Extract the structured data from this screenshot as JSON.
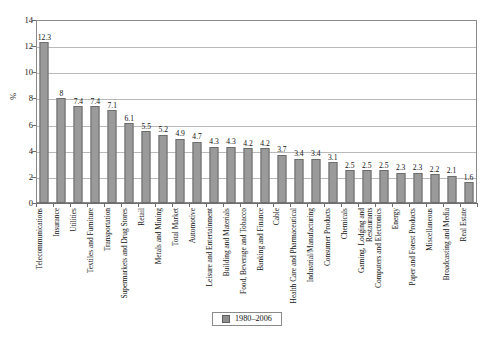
{
  "chart_data": {
    "type": "bar",
    "title": "",
    "xlabel": "",
    "ylabel": "%",
    "ylim": [
      0,
      14
    ],
    "ytick_step": 2,
    "yticks": [
      0,
      2,
      4,
      6,
      8,
      10,
      12,
      14
    ],
    "grid": true,
    "legend_position": "bottom-center",
    "series": [
      {
        "name": "1980–2006",
        "values": [
          12.3,
          8,
          7.4,
          7.4,
          7.1,
          6.1,
          5.5,
          5.2,
          4.9,
          4.7,
          4.3,
          4.3,
          4.2,
          4.2,
          3.7,
          3.4,
          3.4,
          3.1,
          2.5,
          2.5,
          2.5,
          2.3,
          2.3,
          2.2,
          2.1,
          1.6
        ]
      }
    ],
    "categories": [
      "Telecommunications",
      "Insurance",
      "Utilities",
      "Textiles and Furniture",
      "Transportation",
      "Supermarkets and Drug Stores",
      "Retail",
      "Metals and Mining",
      "Total Market",
      "Automotive",
      "Leisure and Entertainment",
      "Building and Materials",
      "Food, Beverage and Tobacco",
      "Banking and Finance",
      "Cable",
      "Health Care and Pharmaceutical",
      "Industrial/Manufacturing",
      "Consumer Products",
      "Chemicals",
      "Gaming, Lodging and Restaurants",
      "Computers and Electronics",
      "Energy",
      "Paper and Forest Products",
      "Miscellaneous",
      "Broadcasting and Media",
      "Real Estate"
    ],
    "value_labels": [
      "12.3",
      "8",
      "7.4",
      "7.4",
      "7.1",
      "6.1",
      "5.5",
      "5.2",
      "4.9",
      "4.7",
      "4.3",
      "4.3",
      "4.2",
      "4.2",
      "3.7",
      "3.4",
      "3.4",
      "3.1",
      "2.5",
      "2.5",
      "2.5",
      "2.3",
      "2.3",
      "2.2",
      "2.1",
      "1.6"
    ],
    "ytick_labels": [
      "0",
      "2",
      "4",
      "6",
      "8",
      "10",
      "12",
      "14"
    ],
    "colors": {
      "bar_fill": "#9a9a9a",
      "bar_border": "#6d6d6d",
      "gridline": "#b9b9b9",
      "axis": "#6e6e6e",
      "text": "#111111"
    }
  },
  "legend": {
    "label": "1980–2006",
    "swatch_name": "series-swatch"
  }
}
